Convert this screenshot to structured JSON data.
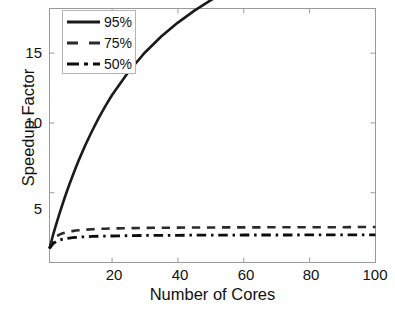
{
  "chart_data": {
    "type": "line",
    "title": "",
    "xlabel": "Number of Cores",
    "ylabel": "Speedup Factor",
    "xlim": [
      1,
      100
    ],
    "ylim": [
      0,
      18.2
    ],
    "xticks": [
      20,
      40,
      60,
      80,
      100
    ],
    "yticks": [
      5,
      10,
      15
    ],
    "xtick_labels": [
      "20",
      "40",
      "60",
      "80",
      "100"
    ],
    "ytick_labels": [
      "5",
      "10",
      "15"
    ],
    "grid": false,
    "legend_position": "upper-left",
    "x": [
      1,
      2,
      3,
      4,
      5,
      6,
      7,
      8,
      9,
      10,
      12,
      14,
      16,
      18,
      20,
      25,
      30,
      35,
      40,
      45,
      50,
      55,
      60,
      65,
      70,
      75,
      80,
      85,
      90,
      95,
      100
    ],
    "series": [
      {
        "name": "95%",
        "label": "95%",
        "style": "solid",
        "color": "#1a1a1a",
        "width": 2.6,
        "parallel_fraction": 0.95,
        "limit": 20,
        "values": [
          1,
          1.9,
          2.71,
          3.48,
          4.21,
          4.91,
          5.57,
          6.2,
          6.81,
          7.39,
          8.47,
          9.46,
          10.38,
          11.22,
          12.0,
          13.67,
          15.05,
          16.21,
          17.19,
          18.05,
          18.8,
          19.46,
          20.05,
          20.58,
          21.06,
          21.49,
          21.89,
          22.26,
          22.6,
          22.91,
          23.2
        ]
      },
      {
        "name": "75%",
        "label": "75%",
        "style": "dashed",
        "color": "#2a2a2a",
        "width": 2.6,
        "parallel_fraction": 0.75,
        "limit": 4,
        "values": [
          1,
          1.6,
          1.85,
          2.0,
          2.09,
          2.16,
          2.21,
          2.25,
          2.29,
          2.31,
          2.35,
          2.38,
          2.41,
          2.42,
          2.44,
          2.46,
          2.48,
          2.49,
          2.5,
          2.51,
          2.51,
          2.52,
          2.52,
          2.52,
          2.53,
          2.53,
          2.53,
          2.53,
          2.53,
          2.54,
          2.54
        ]
      },
      {
        "name": "50%",
        "label": "50%",
        "style": "dashdot",
        "color": "#0d0d0d",
        "width": 2.8,
        "parallel_fraction": 0.5,
        "limit": 2,
        "values": [
          1,
          1.33,
          1.5,
          1.6,
          1.67,
          1.71,
          1.75,
          1.78,
          1.8,
          1.82,
          1.85,
          1.87,
          1.88,
          1.89,
          1.9,
          1.92,
          1.94,
          1.94,
          1.95,
          1.96,
          1.96,
          1.96,
          1.97,
          1.97,
          1.97,
          1.97,
          1.98,
          1.98,
          1.98,
          1.98,
          1.98
        ]
      }
    ],
    "legend": [
      {
        "label": "95%",
        "style": "solid"
      },
      {
        "label": "75%",
        "style": "dashed"
      },
      {
        "label": "50%",
        "style": "dashdot"
      }
    ]
  },
  "axes": {
    "frame_color": "#9a9a9a",
    "tick_color": "#9a9a9a",
    "background": "#ffffff"
  }
}
